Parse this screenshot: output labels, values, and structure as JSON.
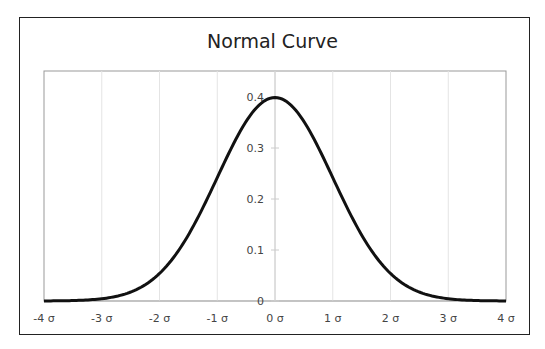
{
  "chart_data": {
    "type": "line",
    "title": "Normal Curve",
    "xlabel": "",
    "ylabel": "",
    "x_ticks": [
      "-4 σ",
      "-3 σ",
      "-2 σ",
      "-1 σ",
      "0 σ",
      "1 σ",
      "2 σ",
      "3 σ",
      "4 σ"
    ],
    "x_tick_values": [
      -4,
      -3,
      -2,
      -1,
      0,
      1,
      2,
      3,
      4
    ],
    "y_ticks": [
      "0",
      "0.1",
      "0.2",
      "0.3",
      "0.4"
    ],
    "y_tick_values": [
      0,
      0.1,
      0.2,
      0.3,
      0.4
    ],
    "xlim": [
      -4,
      4
    ],
    "ylim": [
      0,
      0.45
    ],
    "grid": {
      "vertical": true,
      "horizontal": false
    },
    "legend": "none",
    "series": [
      {
        "name": "Normal density",
        "x": [
          -4,
          -3.5,
          -3,
          -2.5,
          -2,
          -1.5,
          -1,
          -0.5,
          0,
          0.5,
          1,
          1.5,
          2,
          2.5,
          3,
          3.5,
          4
        ],
        "values": [
          0.0001,
          0.0009,
          0.0044,
          0.0175,
          0.054,
          0.1295,
          0.242,
          0.3521,
          0.3989,
          0.3521,
          0.242,
          0.1295,
          0.054,
          0.0175,
          0.0044,
          0.0009,
          0.0001
        ],
        "color": "#111111"
      }
    ]
  }
}
